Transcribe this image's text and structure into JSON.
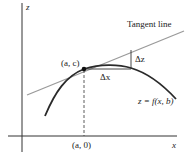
{
  "diagram": {
    "type": "partial-derivative-tangent-line",
    "axes": {
      "z_label": "z",
      "x_label": "x"
    },
    "point_label": "(a, c)",
    "foot_label": "(a, 0)",
    "tangent_label": "Tangent line",
    "delta_x_label": "Δx",
    "delta_z_label": "Δz",
    "curve_label": "z = f(x, b)",
    "colors": {
      "axis": "#333333",
      "curve": "#2a2a2a",
      "tangent": "#9a9a9a",
      "text": "#222222"
    }
  }
}
